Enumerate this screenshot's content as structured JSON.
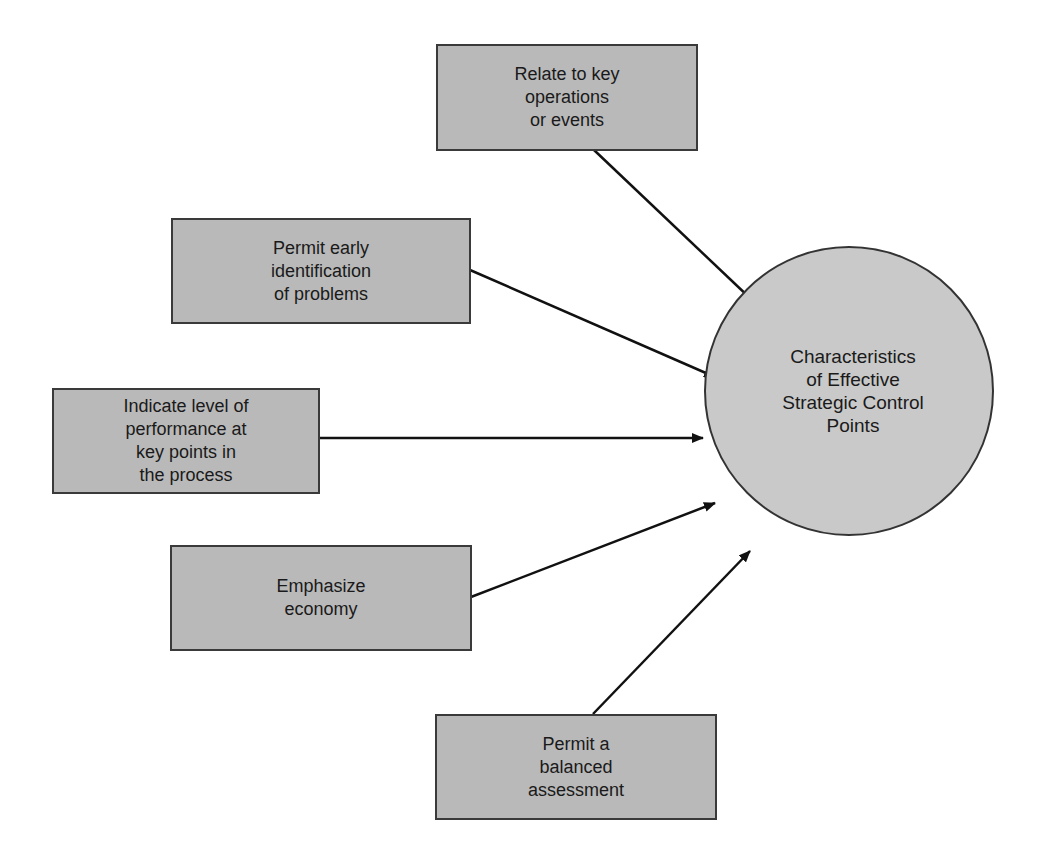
{
  "diagram": {
    "type": "radial-influence-diagram",
    "center": {
      "label": "Characteristics\nof Effective\nStrategic Control\nPoints"
    },
    "nodes": [
      {
        "id": "relate",
        "label": "Relate to key\noperations\nor events"
      },
      {
        "id": "early",
        "label": "Permit early\nidentification\nof problems"
      },
      {
        "id": "indicate",
        "label": "Indicate level of\nperformance at\nkey points in\nthe process"
      },
      {
        "id": "economy",
        "label": "Emphasize\neconomy"
      },
      {
        "id": "balanced",
        "label": "Permit a\nbalanced\nassessment"
      }
    ],
    "edges": [
      {
        "from": "relate",
        "to": "center"
      },
      {
        "from": "early",
        "to": "center"
      },
      {
        "from": "indicate",
        "to": "center"
      },
      {
        "from": "economy",
        "to": "center"
      },
      {
        "from": "balanced",
        "to": "center"
      }
    ],
    "colors": {
      "box_fill": "#b9b9b9",
      "circle_fill": "#c9c9c9",
      "stroke": "#111111",
      "background": "#ffffff"
    }
  }
}
